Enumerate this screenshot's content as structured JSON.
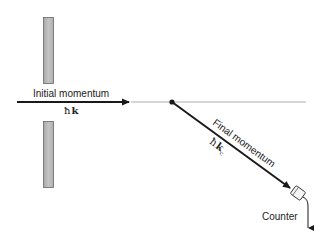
{
  "diagram": {
    "labels": {
      "initial_momentum": "Initial momentum",
      "initial_symbol_hbar": "ħ",
      "initial_symbol_k": "k",
      "final_momentum": "Final momentum",
      "final_symbol_hbar": "ħ",
      "final_symbol_k": "k",
      "final_symbol_sub": "c",
      "counter": "Counter"
    },
    "colors": {
      "slit_fill": "#b8b8b8",
      "slit_stroke": "#666666",
      "arrow": "#1a1a1a",
      "reference_line": "#9a9a9a",
      "text": "#222222"
    },
    "elements": [
      "upper-slit-plate",
      "lower-slit-plate",
      "initial-momentum-arrow",
      "reference-line",
      "scattering-point",
      "final-momentum-arrow",
      "counter-detector",
      "counter-output-arrow"
    ]
  }
}
